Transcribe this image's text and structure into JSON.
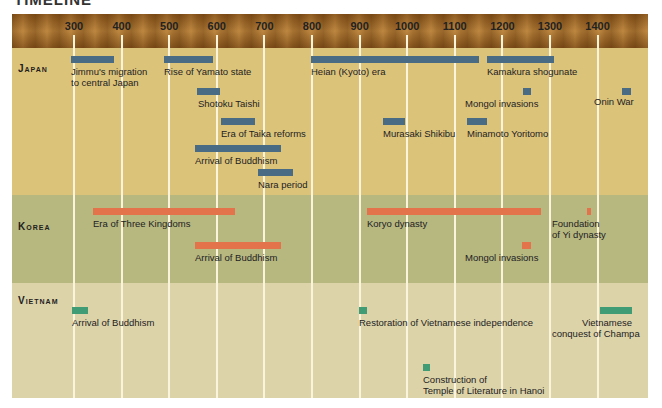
{
  "title": "TIMELINE",
  "axis": {
    "ticks": [
      "300",
      "400",
      "500",
      "600",
      "700",
      "800",
      "900",
      "1000",
      "1100",
      "1200",
      "1300",
      "1400"
    ]
  },
  "regions": {
    "japan": "Japan",
    "korea": "Korea",
    "vietnam": "Vietnam"
  },
  "events": {
    "japan": [
      {
        "label": "Jimmu's migration",
        "label2": "to central Japan",
        "start": 300,
        "end": 390
      },
      {
        "label": "Rise of Yamato state",
        "start": 495,
        "end": 600
      },
      {
        "label": "Heian (Kyoto) era",
        "start": 794,
        "end": 1150
      },
      {
        "label": "Kamakura shogunate",
        "start": 1185,
        "end": 1333
      },
      {
        "label": "Shotoku Taishi",
        "start": 574,
        "end": 622
      },
      {
        "label": "Mongol invasions",
        "start": 1274,
        "end": 1281
      },
      {
        "label": "Onin War",
        "start": 1467,
        "end": 1477
      },
      {
        "label": "Era of Taika reforms",
        "start": 645,
        "end": 710
      },
      {
        "label": "Murasaki Shikibu",
        "start": 978,
        "end": 1014
      },
      {
        "label": "Minamoto Yoritomo",
        "start": 1147,
        "end": 1199
      },
      {
        "label": "Arrival of Buddhism",
        "start": 552,
        "end": 780
      },
      {
        "label": "Nara period",
        "start": 710,
        "end": 784
      }
    ],
    "korea": [
      {
        "label": "Era of Three Kingdoms",
        "start": 313,
        "end": 668
      },
      {
        "label": "Koryo dynasty",
        "start": 918,
        "end": 1392
      },
      {
        "label": "Foundation",
        "label2": "of Yi dynasty",
        "start": 1392,
        "end": 1396
      },
      {
        "label": "Arrival of Buddhism",
        "start": 552,
        "end": 780
      },
      {
        "label": "Mongol invasions",
        "start": 1231,
        "end": 1259
      }
    ],
    "vietnam": [
      {
        "label": "Arrival of Buddhism",
        "start": 300,
        "end": 340
      },
      {
        "label": "Restoration of Vietnamese independence",
        "start": 939,
        "end": 959
      },
      {
        "label": "Vietnamese",
        "label2": "conquest of Champa",
        "start": 1400,
        "end": 1471
      },
      {
        "label": "Construction of",
        "label2": "Temple of Literature in Hanoi",
        "start": 1070,
        "end": 1090
      }
    ]
  },
  "colors": {
    "japan_bar": "#4a6b84",
    "korea_bar": "#e2734a",
    "vietnam_bar": "#3f9c74",
    "japan_band": "#dcc37a",
    "korea_band": "#b7b780",
    "vietnam_band": "#ddd3a9"
  },
  "chart_data": {
    "type": "timeline",
    "title": "Timeline",
    "xlabel": "Year (CE)",
    "xlim": [
      250,
      1480
    ],
    "x_ticks": [
      300,
      400,
      500,
      600,
      700,
      800,
      900,
      1000,
      1100,
      1200,
      1300,
      1400
    ],
    "grid": true,
    "series": [
      {
        "name": "Japan",
        "items": [
          {
            "label": "Jimmu's migration to central Japan",
            "start": 300,
            "end": 390
          },
          {
            "label": "Rise of Yamato state",
            "start": 495,
            "end": 600
          },
          {
            "label": "Heian (Kyoto) era",
            "start": 794,
            "end": 1150
          },
          {
            "label": "Kamakura shogunate",
            "start": 1185,
            "end": 1333
          },
          {
            "label": "Shotoku Taishi",
            "start": 574,
            "end": 622
          },
          {
            "label": "Mongol invasions",
            "start": 1274,
            "end": 1281
          },
          {
            "label": "Onin War",
            "start": 1467,
            "end": 1477
          },
          {
            "label": "Era of Taika reforms",
            "start": 645,
            "end": 710
          },
          {
            "label": "Murasaki Shikibu",
            "start": 978,
            "end": 1014
          },
          {
            "label": "Minamoto Yoritomo",
            "start": 1147,
            "end": 1199
          },
          {
            "label": "Arrival of Buddhism",
            "start": 552,
            "end": 780
          },
          {
            "label": "Nara period",
            "start": 710,
            "end": 784
          }
        ]
      },
      {
        "name": "Korea",
        "items": [
          {
            "label": "Era of Three Kingdoms",
            "start": 313,
            "end": 668
          },
          {
            "label": "Koryo dynasty",
            "start": 918,
            "end": 1392
          },
          {
            "label": "Foundation of Yi dynasty",
            "start": 1392,
            "end": 1396
          },
          {
            "label": "Arrival of Buddhism",
            "start": 552,
            "end": 780
          },
          {
            "label": "Mongol invasions",
            "start": 1231,
            "end": 1259
          }
        ]
      },
      {
        "name": "Vietnam",
        "items": [
          {
            "label": "Arrival of Buddhism",
            "start": 300,
            "end": 340
          },
          {
            "label": "Restoration of Vietnamese independence",
            "start": 939,
            "end": 959
          },
          {
            "label": "Vietnamese conquest of Champa",
            "start": 1400,
            "end": 1471
          },
          {
            "label": "Construction of Temple of Literature in Hanoi",
            "start": 1070,
            "end": 1090
          }
        ]
      }
    ]
  }
}
